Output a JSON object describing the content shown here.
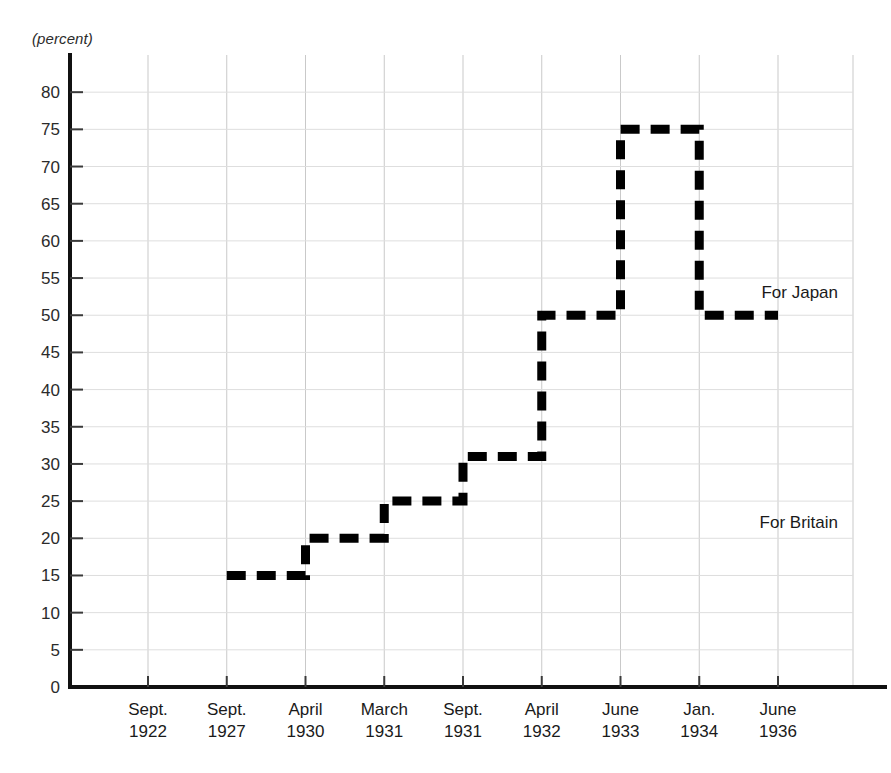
{
  "chart_data": {
    "type": "line",
    "subtype": "step",
    "title": "",
    "xlabel": "",
    "ylabel": "(percent)",
    "ylim": [
      0,
      85
    ],
    "yticks": [
      0,
      5,
      10,
      15,
      20,
      25,
      30,
      35,
      40,
      45,
      50,
      55,
      60,
      65,
      70,
      75,
      80
    ],
    "grid": true,
    "legend_position": "inline-annotation",
    "categories": [
      "Sept. 1922",
      "Sept. 1927",
      "April 1930",
      "March 1931",
      "Sept. 1931",
      "April 1932",
      "June 1933",
      "Jan. 1934",
      "June 1936"
    ],
    "xtick_labels": [
      {
        "month": "Sept.",
        "year": "1922"
      },
      {
        "month": "Sept.",
        "year": "1927"
      },
      {
        "month": "April",
        "year": "1930"
      },
      {
        "month": "March",
        "year": "1931"
      },
      {
        "month": "Sept.",
        "year": "1931"
      },
      {
        "month": "April",
        "year": "1932"
      },
      {
        "month": "June",
        "year": "1933"
      },
      {
        "month": "Jan.",
        "year": "1934"
      },
      {
        "month": "June",
        "year": "1936"
      }
    ],
    "series": [
      {
        "name": "Japanese naval ratio relative to Britain",
        "style": "dashed",
        "color": "#000000",
        "steps": [
          {
            "from": "Sept. 1927",
            "to": "April 1930",
            "value": 15
          },
          {
            "from": "April 1930",
            "to": "March 1931",
            "value": 20
          },
          {
            "from": "March 1931",
            "to": "Sept. 1931",
            "value": 25
          },
          {
            "from": "Sept. 1931",
            "to": "April 1932",
            "value": 31
          },
          {
            "from": "April 1932",
            "to": "June 1933",
            "value": 50
          },
          {
            "from": "June 1933",
            "to": "Jan. 1934",
            "value": 75
          },
          {
            "from": "Jan. 1934",
            "to": "June 1936",
            "value": 50
          }
        ],
        "values": [
          null,
          15,
          20,
          25,
          31,
          50,
          75,
          50,
          50
        ]
      }
    ],
    "annotations": [
      {
        "text": "For Japan",
        "x": 0.955,
        "y": 53
      },
      {
        "text": "For Britain",
        "x": 0.955,
        "y": 22
      }
    ]
  },
  "axis": {
    "unit_label": "(percent)"
  }
}
